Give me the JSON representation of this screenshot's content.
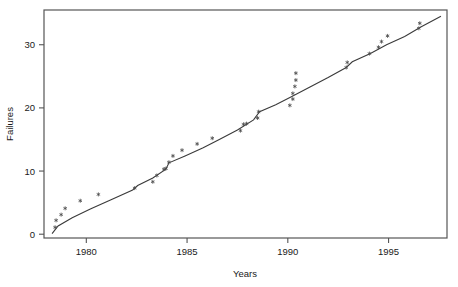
{
  "chart_data": {
    "type": "scatter",
    "title": "",
    "xlabel": "Years",
    "ylabel": "Failures",
    "xlim": [
      1977.9,
      1997.9
    ],
    "ylim": [
      -0.6,
      35.5
    ],
    "xticks": [
      1980,
      1985,
      1990,
      1995
    ],
    "xtick_labels": [
      "1980",
      "1985",
      "1990",
      "1995"
    ],
    "yticks": [
      0,
      10,
      20,
      30
    ],
    "ytick_labels": [
      "0",
      "10",
      "20",
      "30"
    ],
    "grid": false,
    "legend": "none",
    "marker": "asterisk",
    "marker_color": "#4a4a4a",
    "line_color": "#3a3a3a",
    "frame_color": "#555555",
    "background": "#ffffff",
    "series": [
      {
        "name": "Failures (observed)",
        "type": "scatter",
        "points": [
          [
            1978.45,
            1.1
          ],
          [
            1978.5,
            2.2
          ],
          [
            1978.75,
            3.1
          ],
          [
            1978.95,
            4.1
          ],
          [
            1979.7,
            5.3
          ],
          [
            1980.6,
            6.3
          ],
          [
            1982.4,
            7.3
          ],
          [
            1983.3,
            8.3
          ],
          [
            1983.5,
            9.3
          ],
          [
            1983.85,
            10.3
          ],
          [
            1983.95,
            10.4
          ],
          [
            1984.1,
            11.4
          ],
          [
            1984.3,
            12.4
          ],
          [
            1984.75,
            13.3
          ],
          [
            1985.5,
            14.3
          ],
          [
            1986.25,
            15.2
          ],
          [
            1987.65,
            16.4
          ],
          [
            1987.8,
            17.4
          ],
          [
            1987.95,
            17.5
          ],
          [
            1988.5,
            18.4
          ],
          [
            1988.55,
            19.4
          ],
          [
            1990.1,
            20.4
          ],
          [
            1990.25,
            21.4
          ],
          [
            1990.25,
            22.3
          ],
          [
            1990.35,
            23.4
          ],
          [
            1990.4,
            24.4
          ],
          [
            1990.4,
            25.5
          ],
          [
            1992.9,
            26.4
          ],
          [
            1992.95,
            27.2
          ],
          [
            1994.05,
            28.6
          ],
          [
            1994.5,
            29.6
          ],
          [
            1994.65,
            30.5
          ],
          [
            1994.95,
            31.4
          ],
          [
            1996.5,
            32.6
          ],
          [
            1996.55,
            33.4
          ]
        ]
      },
      {
        "name": "Fitted trend",
        "type": "line",
        "points": [
          [
            1978.3,
            0.1
          ],
          [
            1978.6,
            1.3
          ],
          [
            1979.3,
            2.6
          ],
          [
            1980.2,
            4.0
          ],
          [
            1981.2,
            5.4
          ],
          [
            1982.3,
            7.0
          ],
          [
            1982.55,
            7.7
          ],
          [
            1983.3,
            8.9
          ],
          [
            1983.95,
            10.3
          ],
          [
            1984.1,
            11.3
          ],
          [
            1984.9,
            12.4
          ],
          [
            1985.8,
            13.7
          ],
          [
            1986.6,
            15.0
          ],
          [
            1987.5,
            16.5
          ],
          [
            1988.3,
            18.1
          ],
          [
            1988.6,
            19.4
          ],
          [
            1989.4,
            20.5
          ],
          [
            1990.2,
            21.8
          ],
          [
            1991.1,
            23.3
          ],
          [
            1992.0,
            24.8
          ],
          [
            1992.9,
            26.4
          ],
          [
            1993.2,
            27.3
          ],
          [
            1994.1,
            28.6
          ],
          [
            1994.9,
            30.0
          ],
          [
            1995.8,
            31.3
          ],
          [
            1996.6,
            32.8
          ],
          [
            1997.6,
            34.5
          ]
        ]
      }
    ]
  }
}
